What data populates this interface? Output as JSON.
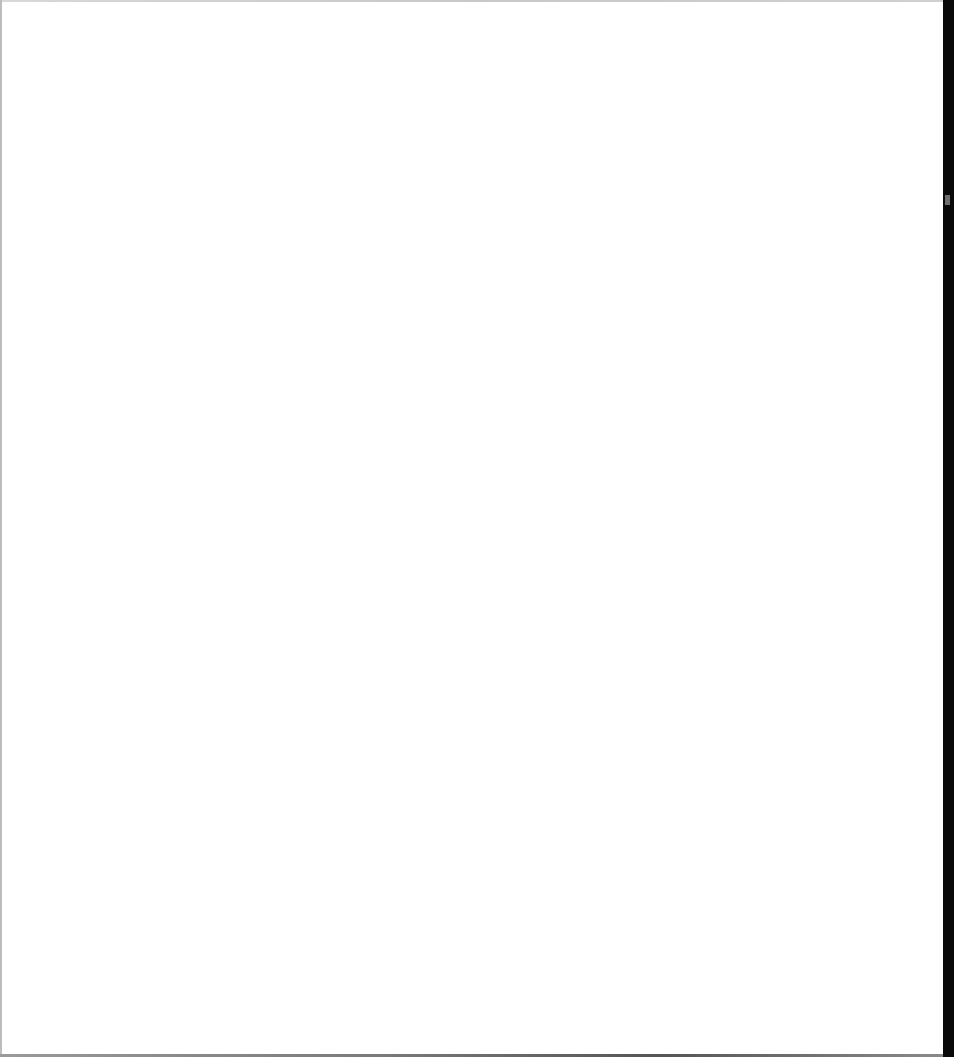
{
  "window": {
    "state": "blank",
    "background_color": "#ffffff",
    "frame_color": "#bdbdbd",
    "right_edge_color": "#0a0a0a"
  },
  "scrollbar": {
    "orientation": "vertical",
    "thumb_color": "#6e6e6e"
  }
}
